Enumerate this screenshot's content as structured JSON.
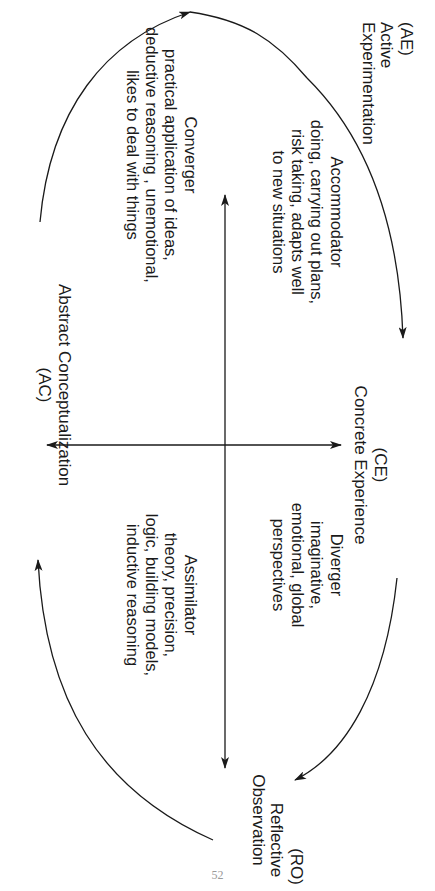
{
  "diagram": {
    "type": "Kolb learning cycle / learning styles",
    "orientation": "rotated 90 degrees clockwise",
    "poles": {
      "top": {
        "abbr": "(CE)",
        "name": "Concrete Experience"
      },
      "right": {
        "abbr": "(RO)",
        "name_line1": "Reflective",
        "name_line2": "Observation"
      },
      "bottom": {
        "abbr": "(AC)",
        "name": "Abstract Conceptualization"
      },
      "left": {
        "abbr": "(AE)",
        "name_line1": "Active",
        "name_line2": "Experimentation"
      }
    },
    "quadrants": {
      "accommodator": {
        "title": "Accommodator",
        "lines": [
          "doing, carrying out plans,",
          "risk taking, adapts well",
          "to new situations"
        ]
      },
      "diverger": {
        "title": "Diverger",
        "lines": [
          "imaginative,",
          "emotional, global",
          "perspectives"
        ]
      },
      "converger": {
        "title": "Converger",
        "lines": [
          "practical application of ideas,",
          "deductive reasoning , unemotional,",
          "likes to deal with things"
        ]
      },
      "assimilator": {
        "title": "Assimilator",
        "lines": [
          "theory, precision,",
          "logic, building models,",
          "inductive reasoning"
        ]
      }
    },
    "cycle_arrows": [
      "AE → CE",
      "CE → RO",
      "RO → AC",
      "AC → AE"
    ],
    "axis_arrows": [
      "AE ↔ RO (horizontal)",
      "CE ↔ AC (vertical)"
    ],
    "colors": {
      "ink": "#1a1a1a",
      "paper": "#ffffff"
    }
  },
  "page": {
    "number": "52"
  }
}
